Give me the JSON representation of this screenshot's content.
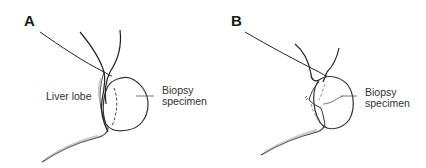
{
  "figure": {
    "panels": [
      {
        "letter": "A",
        "labels": {
          "liver_lobe": "Liver lobe",
          "biopsy_line1": "Biopsy",
          "biopsy_line2": "specimen"
        }
      },
      {
        "letter": "B",
        "labels": {
          "biopsy_line1": "Biopsy",
          "biopsy_line2": "specimen"
        }
      }
    ]
  }
}
